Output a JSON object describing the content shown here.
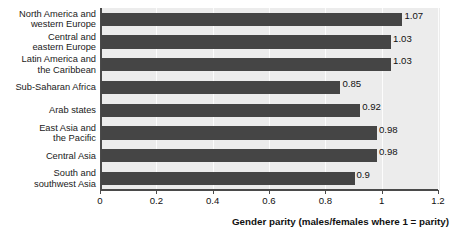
{
  "chart_data": {
    "type": "bar",
    "orientation": "horizontal",
    "title": "",
    "xlabel": "Gender parity (males/females where 1 = parity)",
    "ylabel": "",
    "xlim": [
      0,
      1.2
    ],
    "xticks": [
      "0",
      "0.2",
      "0.4",
      "0.6",
      "0.8",
      "1",
      "1.2"
    ],
    "xtick_values": [
      0,
      0.2,
      0.4,
      0.6,
      0.8,
      1,
      1.2
    ],
    "grid": true,
    "legend": false,
    "bar_color": "#454545",
    "plot_background": "#ececec",
    "categories": [
      "North America and\nwestern Europe",
      "Central and\neastern Europe",
      "Latin America and\nthe Caribbean",
      "Sub-Saharan Africa",
      "Arab states",
      "East Asia and\nthe Pacific",
      "Central Asia",
      "South and\nsouthwest Asia"
    ],
    "values": [
      1.07,
      1.03,
      1.03,
      0.85,
      0.92,
      0.98,
      0.98,
      0.9
    ],
    "value_labels": [
      "1.07",
      "1.03",
      "1.03",
      "0.85",
      "0.92",
      "0.98",
      "0.98",
      "0.9"
    ]
  }
}
